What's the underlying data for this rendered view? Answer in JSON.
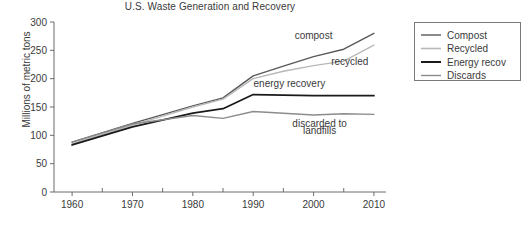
{
  "chart_data": {
    "type": "line",
    "title": "U.S. Waste Generation and Recovery",
    "xlabel": "",
    "ylabel": "Millions of metric tons",
    "xlim": [
      1957,
      2012
    ],
    "ylim": [
      0,
      300
    ],
    "yticks": [
      "0",
      "50",
      "100",
      "150",
      "200",
      "250",
      "300"
    ],
    "ytick_values": [
      0,
      50,
      100,
      150,
      200,
      250,
      300
    ],
    "xticks": [
      "1960",
      "1970",
      "1980",
      "1990",
      "2000",
      "2010"
    ],
    "xtick_values": [
      1960,
      1970,
      1980,
      1990,
      2000,
      2010
    ],
    "xminor_values": [
      1965,
      1975,
      1985,
      1995,
      2005
    ],
    "grid": false,
    "legend_position": "outside-right-top",
    "x": [
      1960,
      1970,
      1980,
      1985,
      1990,
      1995,
      2000,
      2005,
      2010
    ],
    "series": [
      {
        "name": "Compost",
        "color": "#595959",
        "width": 1.4,
        "values": [
          88,
          121,
          152,
          166,
          205,
          222,
          239,
          252,
          280
        ]
      },
      {
        "name": "Recycled",
        "color": "#b8b8b8",
        "width": 1.4,
        "values": [
          85,
          118,
          150,
          164,
          200,
          213,
          223,
          231,
          259
        ]
      },
      {
        "name": "Energy recov",
        "color": "#1a1a1a",
        "width": 1.8,
        "values": [
          83,
          115,
          139,
          147,
          172,
          171,
          170,
          170,
          170
        ]
      },
      {
        "name": "Discards",
        "color": "#8c8c8c",
        "width": 1.4,
        "values": [
          88,
          120,
          135,
          130,
          142,
          139,
          136,
          138,
          137
        ]
      }
    ],
    "annotations": [
      {
        "text": "compost",
        "x": 2000,
        "y": 270,
        "anchor": "middle"
      },
      {
        "text": "recycled",
        "x": 2006,
        "y": 224,
        "anchor": "middle"
      },
      {
        "text": "energy recovery",
        "x": 1996,
        "y": 186,
        "anchor": "middle"
      },
      {
        "text": "discarded to",
        "x": 2001,
        "y": 114,
        "anchor": "middle"
      },
      {
        "text": "landfills",
        "x": 2001,
        "y": 103,
        "anchor": "middle"
      }
    ]
  },
  "legend": {
    "items": [
      {
        "label": "Compost",
        "color": "#595959",
        "width": 1.4
      },
      {
        "label": "Recycled",
        "color": "#b8b8b8",
        "width": 1.6
      },
      {
        "label": "Energy recov",
        "color": "#1a1a1a",
        "width": 2.0
      },
      {
        "label": "Discards",
        "color": "#8c8c8c",
        "width": 1.4
      }
    ]
  },
  "axes": {
    "line_color": "#6b6b6b",
    "text_color": "#3a3a3a"
  }
}
